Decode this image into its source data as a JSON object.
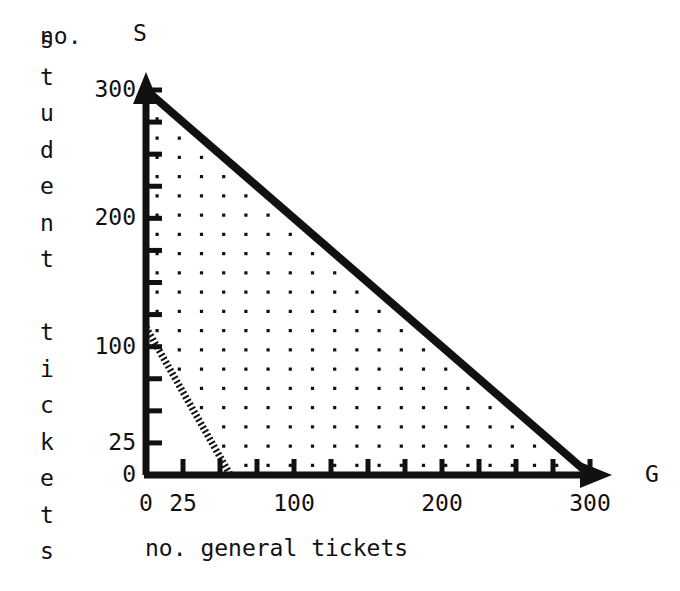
{
  "chart_data": {
    "type": "line",
    "title": "",
    "subtitle": "",
    "xlabel": "no. general tickets",
    "ylabel": "no. student tickets",
    "x_axis_variable": "G",
    "y_axis_variable": "S",
    "xlim": [
      0,
      300
    ],
    "ylim": [
      0,
      300
    ],
    "xticks_major": [
      0,
      25,
      100,
      200,
      300
    ],
    "xticks_major_labels": [
      "0",
      "25",
      "100",
      "200",
      "300"
    ],
    "yticks_major": [
      0,
      25,
      100,
      200,
      300
    ],
    "yticks_major_labels": [
      "0",
      "25",
      "100",
      "200",
      "300"
    ],
    "tick_step_minor": 25,
    "grid": false,
    "legend": "none",
    "marker_grid": {
      "description": "lattice of dots marking integer feasible solutions",
      "spacing": 15,
      "dot_color": "#111111"
    },
    "series": [
      {
        "name": "capacity-boundary",
        "style": "solid-thick",
        "color": "#111111",
        "equation": "G + S = 300",
        "points": [
          {
            "x": 0,
            "y": 300
          },
          {
            "x": 300,
            "y": 0
          }
        ]
      },
      {
        "name": "secondary-constraint",
        "style": "dotted-thick",
        "color": "#111111",
        "equation": "2G + S = 115",
        "points": [
          {
            "x": 0,
            "y": 115
          },
          {
            "x": 57,
            "y": 0
          }
        ]
      }
    ],
    "shaded_region": {
      "name": "feasible-region",
      "fill": "dot-lattice",
      "vertices": [
        {
          "x": 0,
          "y": 115
        },
        {
          "x": 0,
          "y": 300
        },
        {
          "x": 300,
          "y": 0
        },
        {
          "x": 57,
          "y": 0
        }
      ]
    },
    "annotations": []
  },
  "axis_captions": {
    "y_prefix": "no.",
    "y_letters": [
      "s",
      "t",
      "u",
      "d",
      "e",
      "n",
      "t",
      "",
      "t",
      "i",
      "c",
      "k",
      "e",
      "t",
      "s"
    ],
    "x_caption": "no. general tickets"
  },
  "colors": {
    "ink": "#111111",
    "paper": "#ffffff",
    "dotted": "#111111"
  }
}
